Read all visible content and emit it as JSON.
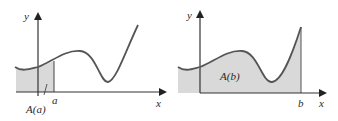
{
  "figure": {
    "colors": {
      "curve": "#555555",
      "axis": "#2a2a2a",
      "shade": "#d9d9d9",
      "background": "#ffffff"
    },
    "left_panel": {
      "y_axis_label": "y",
      "x_axis_label": "x",
      "marker_label": "a",
      "area_label": "A(a)"
    },
    "right_panel": {
      "y_axis_label": "y",
      "x_axis_label": "x",
      "marker_label": "b",
      "area_label": "A(b)"
    }
  }
}
